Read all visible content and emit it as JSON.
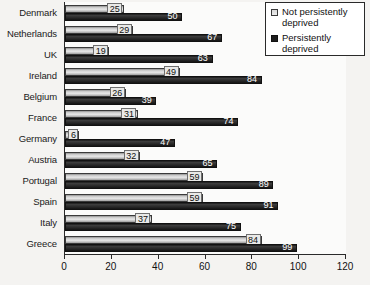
{
  "chart_data": {
    "type": "bar",
    "orientation": "horizontal",
    "title": "",
    "xlabel": "",
    "ylabel": "",
    "xlim": [
      0,
      120
    ],
    "xticks": [
      0,
      20,
      40,
      60,
      80,
      100,
      120
    ],
    "grid": false,
    "legend_position": "top-right",
    "categories": [
      "Denmark",
      "Netherlands",
      "UK",
      "Ireland",
      "Belgium",
      "France",
      "Germany",
      "Austria",
      "Portugal",
      "Spain",
      "Italy",
      "Greece"
    ],
    "series": [
      {
        "name": "Not persistently deprived",
        "color": "#d9d9d9",
        "values": [
          25,
          29,
          19,
          49,
          26,
          31,
          6,
          32,
          59,
          59,
          37,
          84
        ]
      },
      {
        "name": "Persistently deprived",
        "color": "#1e1e1e",
        "values": [
          50,
          67,
          63,
          84,
          39,
          74,
          47,
          65,
          89,
          91,
          75,
          99
        ]
      }
    ]
  },
  "legend": {
    "items": [
      {
        "label": "Not persistently deprived",
        "swatch": "light-square-icon"
      },
      {
        "label": "Persistently deprived",
        "swatch": "dark-square-icon"
      }
    ]
  }
}
